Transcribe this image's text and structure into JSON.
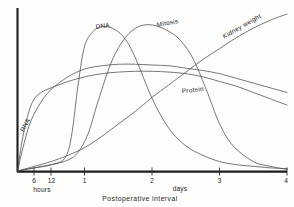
{
  "chart_data": {
    "type": "line",
    "title": "",
    "subtitle": "",
    "xlabel": "Postoperative interval",
    "ylabel": "",
    "xlim": [
      0,
      4
    ],
    "ylim": [
      0,
      100
    ],
    "grid": false,
    "legend_position": "inline-curve-labels",
    "x_unit_labels": [
      "hours",
      "days"
    ],
    "x_tick_labels": [
      "6",
      "12",
      "1",
      "2",
      "3",
      "4"
    ],
    "x_tick_values": [
      0.25,
      0.5,
      1,
      2,
      3,
      4
    ],
    "y_axis_visible": true,
    "y_ticks_visible": false,
    "annotations": [
      "RNA",
      "DNA",
      "Mitosis",
      "Protein",
      "Kidney weight"
    ],
    "series": [
      {
        "name": "RNA",
        "label": "RNA",
        "label_rotation": -62,
        "color": "#4a4a4a",
        "x": [
          0,
          0.08,
          0.17,
          0.25,
          0.35,
          0.5,
          0.75,
          1.0,
          1.25,
          1.5,
          1.75,
          2.0,
          2.25,
          2.5,
          2.75,
          3.0,
          3.25,
          3.5,
          3.75,
          4.0
        ],
        "values": [
          0,
          22,
          38,
          46,
          50,
          53,
          57,
          60,
          62,
          63,
          63.5,
          63.5,
          63,
          62,
          60,
          57,
          54,
          50,
          46,
          42
        ]
      },
      {
        "name": "DNA",
        "label": "DNA",
        "label_rotation": -8,
        "color": "#4a4a4a",
        "x": [
          0,
          0.25,
          0.5,
          0.7,
          0.8,
          0.9,
          1.0,
          1.15,
          1.3,
          1.45,
          1.6,
          1.75,
          2.0,
          2.25,
          2.5,
          2.75,
          3.0,
          3.25,
          3.5,
          3.75,
          4.0
        ],
        "values": [
          0,
          2,
          4,
          8,
          22,
          55,
          80,
          90,
          92,
          90,
          84,
          72,
          46,
          27,
          16,
          10,
          6,
          4,
          3,
          2,
          1.5
        ]
      },
      {
        "name": "Mitosis",
        "label": "Mitosis",
        "label_rotation": -10,
        "color": "#4a4a4a",
        "x": [
          0,
          0.25,
          0.5,
          0.75,
          0.9,
          1.05,
          1.2,
          1.4,
          1.6,
          1.8,
          2.0,
          2.2,
          2.4,
          2.6,
          2.8,
          3.0,
          3.2,
          3.5,
          3.75,
          4.0
        ],
        "values": [
          0,
          2,
          4,
          7,
          12,
          24,
          45,
          70,
          85,
          92,
          93,
          90,
          84,
          72,
          52,
          30,
          16,
          6,
          3,
          1
        ]
      },
      {
        "name": "Protein",
        "label": "Protein",
        "label_rotation": -6,
        "color": "#4a4a4a",
        "x": [
          0,
          0.1,
          0.2,
          0.35,
          0.5,
          0.75,
          1.0,
          1.25,
          1.5,
          1.75,
          2.0,
          2.25,
          2.5,
          2.75,
          3.0,
          3.25,
          3.5,
          3.75,
          4.0
        ],
        "values": [
          0,
          18,
          32,
          44,
          52,
          60,
          65,
          67,
          68,
          68,
          67.5,
          67,
          65.5,
          64,
          62,
          59,
          56,
          53,
          50
        ]
      },
      {
        "name": "Kidney weight",
        "label": "Kidney weight",
        "label_rotation": -30,
        "color": "#4a4a4a",
        "x": [
          0,
          0.25,
          0.5,
          0.75,
          1.0,
          1.25,
          1.5,
          1.75,
          2.0,
          2.25,
          2.5,
          2.75,
          3.0,
          3.25,
          3.5,
          3.75,
          4.0
        ],
        "values": [
          0,
          3,
          6,
          10,
          15,
          22,
          30,
          38,
          47,
          55,
          63,
          71,
          78,
          85,
          91,
          96,
          100
        ]
      }
    ]
  },
  "axis": {
    "x_title": "Postoperative interval",
    "hours_label": "hours",
    "days_label": "days",
    "tick_6": "6",
    "tick_12": "12",
    "tick_1": "1",
    "tick_2": "2",
    "tick_3": "3",
    "tick_4": "4"
  },
  "curve_labels": {
    "rna": "RNA",
    "dna": "DNA",
    "mitosis": "Mitosis",
    "protein": "Protein",
    "kidney_weight": "Kidney weight"
  },
  "colors": {
    "curve": "#4a4a4a",
    "axis": "#1c1c1c",
    "text": "#1f1f1f",
    "background": "#fdfdfc"
  }
}
